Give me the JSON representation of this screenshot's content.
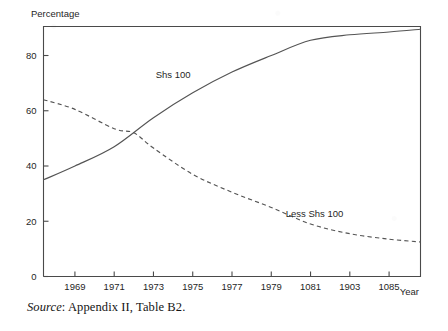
{
  "figure": {
    "y_axis_title": "Percentage",
    "x_axis_title": "Year",
    "source_prefix": "Source",
    "source_text": ": Appendix II, Table B2."
  },
  "chart_data": {
    "type": "line",
    "title": "",
    "xlabel": "Year",
    "ylabel": "Percentage",
    "xlim": [
      1967.4,
      1986.6
    ],
    "ylim": [
      0,
      90.5
    ],
    "grid": false,
    "legend": "inline-annotations",
    "xticks": [
      1969,
      1971,
      1973,
      1975,
      1977,
      1979,
      1981,
      1983,
      1985
    ],
    "xtick_labels": [
      "1969",
      "1971",
      "1973",
      "1975",
      "1977",
      "1979",
      "1081",
      "1903",
      "1085"
    ],
    "yticks": [
      0,
      20,
      40,
      60,
      80
    ],
    "ytick_labels": [
      "0",
      "20",
      "40",
      "60",
      "80"
    ],
    "series": [
      {
        "name": "Shs 100",
        "style": "solid",
        "label_x": 1974.0,
        "label_y": 72.0,
        "x": [
          1967.4,
          1969,
          1971,
          1973,
          1975,
          1977,
          1979,
          1981,
          1983,
          1985,
          1986.6
        ],
        "values": [
          35.0,
          40.0,
          47.0,
          57.5,
          66.5,
          74.0,
          80.0,
          85.5,
          87.5,
          88.5,
          89.5
        ]
      },
      {
        "name": "Less Shs 100",
        "style": "dashed",
        "label_x": 1981.2,
        "label_y": 21.5,
        "x": [
          1967.4,
          1969,
          1971,
          1972,
          1973,
          1975,
          1977,
          1979,
          1981,
          1983,
          1985,
          1986.6
        ],
        "values": [
          64.0,
          60.5,
          53.5,
          52.0,
          46.5,
          37.0,
          30.5,
          25.0,
          19.0,
          15.5,
          13.5,
          12.5
        ]
      }
    ]
  }
}
